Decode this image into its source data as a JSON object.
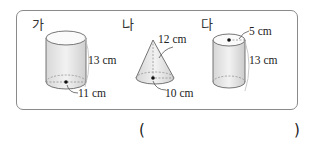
{
  "figures": [
    {
      "id": "ga",
      "label": "가",
      "shape": "cylinder",
      "height": "13 cm",
      "diameter": "11 cm"
    },
    {
      "id": "na",
      "label": "나",
      "shape": "cone",
      "slant": "12 cm",
      "diameter": "10 cm"
    },
    {
      "id": "da",
      "label": "다",
      "shape": "cylinder",
      "radius": "5 cm",
      "height": "13 cm"
    }
  ],
  "answer": {
    "open": "(",
    "close": ")",
    "value": ""
  }
}
